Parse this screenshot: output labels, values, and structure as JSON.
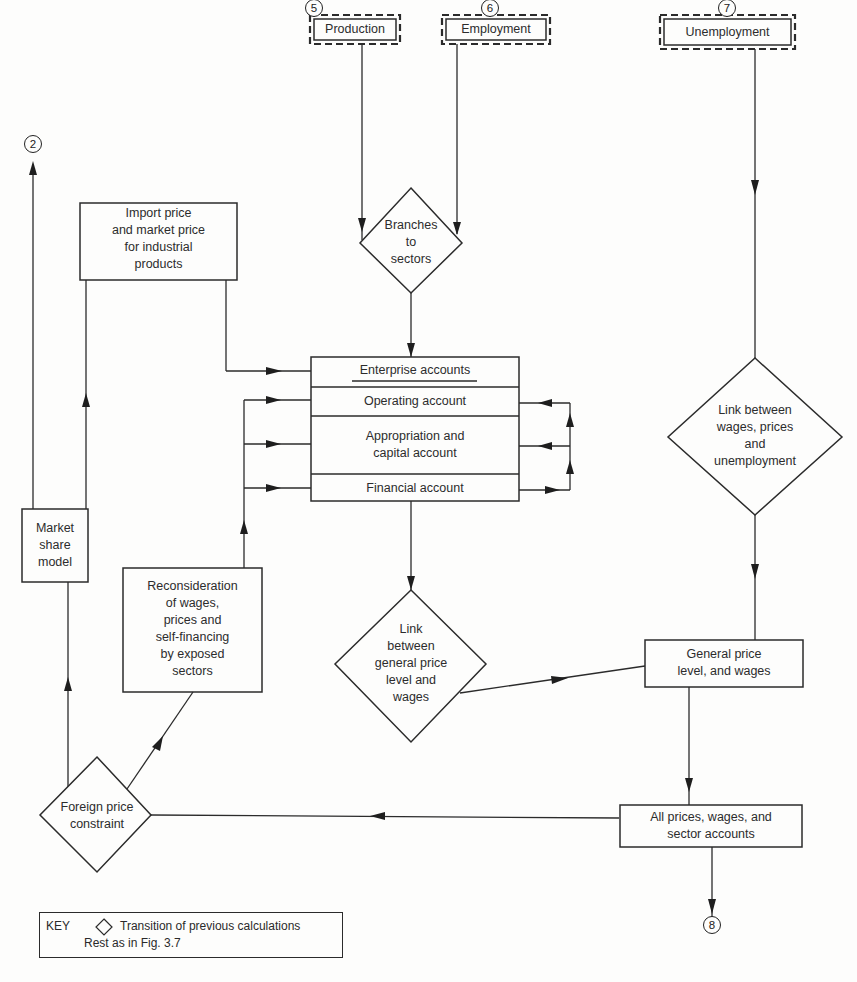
{
  "connectors": {
    "c2": "2",
    "c5": "5",
    "c6": "6",
    "c7": "7",
    "c8": "8"
  },
  "inputs": {
    "production": "Production",
    "employment": "Employment",
    "unemployment": "Unemployment"
  },
  "boxes": {
    "import_price": [
      "Import price",
      "and market price",
      "for industrial",
      "products"
    ],
    "market_share": [
      "Market",
      "share",
      "model"
    ],
    "reconsideration": [
      "Reconsideration",
      "of wages,",
      "prices and",
      "self-financing",
      "by exposed",
      "sectors"
    ],
    "general_price": [
      "General price",
      "level, and wages"
    ],
    "all_prices": [
      "All prices, wages, and",
      "sector accounts"
    ]
  },
  "enterprise": {
    "title": "Enterprise accounts",
    "rows": [
      "Operating account",
      "Appropriation and capital account",
      "Financial account"
    ],
    "row2_lines": [
      "Appropriation and",
      "capital account"
    ]
  },
  "diamonds": {
    "branches": [
      "Branches",
      "to",
      "sectors"
    ],
    "link_unemployment": [
      "Link between",
      "wages, prices",
      "and",
      "unemployment"
    ],
    "link_general": [
      "Link",
      "between",
      "general price",
      "level and",
      "wages"
    ],
    "foreign": [
      "Foreign price",
      "constraint"
    ]
  },
  "key": {
    "label": "KEY",
    "symbol": "diamond",
    "line1": "Transition of previous calculations",
    "line2": "Rest as in Fig. 3.7"
  }
}
